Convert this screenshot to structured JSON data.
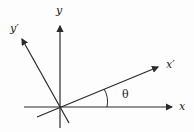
{
  "diagram": {
    "labels": {
      "x": "x",
      "y": "y",
      "x_prime": "x′",
      "y_prime": "y′",
      "theta": "θ"
    },
    "colors": {
      "line": "#2a2a2a",
      "background": "#fdfdfd"
    }
  }
}
